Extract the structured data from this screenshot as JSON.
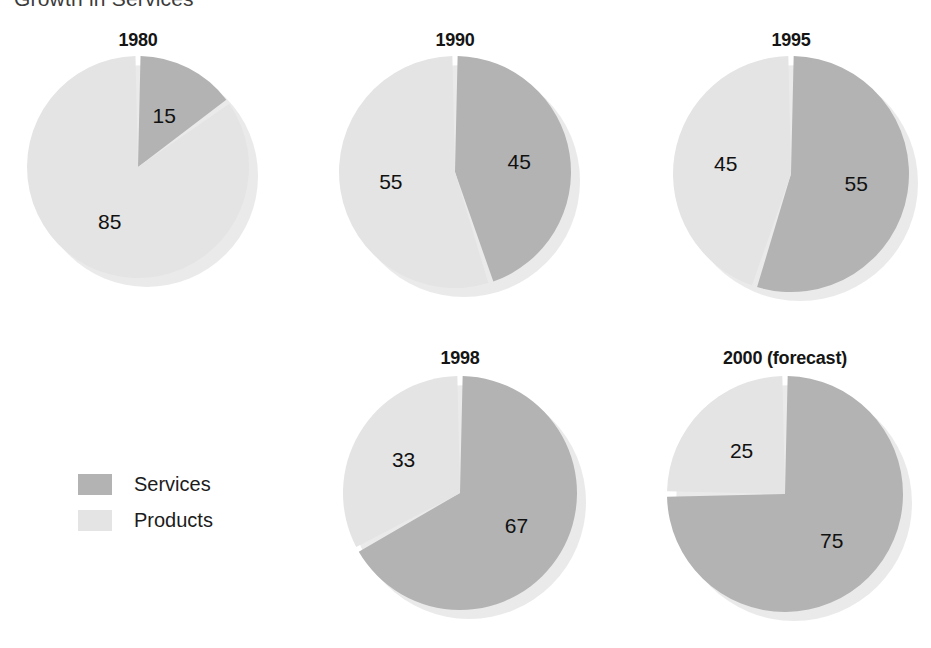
{
  "title": "Growth in Services",
  "legend": {
    "position": "left-middle",
    "items": [
      {
        "label": "Services",
        "color": "#b3b3b3",
        "key": "services"
      },
      {
        "label": "Products",
        "color": "#e4e4e4",
        "key": "products"
      }
    ]
  },
  "colors": {
    "services": "#b3b3b3",
    "products": "#e4e4e4",
    "slice_gap": "#ffffff",
    "shadow": "#d9d9d9",
    "text": "#111111"
  },
  "panels": [
    {
      "title": "1980",
      "services": 15,
      "products": 85,
      "labels": {
        "services": "15",
        "products": "85"
      }
    },
    {
      "title": "1990",
      "services": 45,
      "products": 55,
      "labels": {
        "services": "45",
        "products": "55"
      }
    },
    {
      "title": "1995",
      "services": 55,
      "products": 45,
      "labels": {
        "services": "55",
        "products": "45"
      }
    },
    {
      "title": "1998",
      "services": 67,
      "products": 33,
      "labels": {
        "services": "67",
        "products": "33"
      }
    },
    {
      "title": "2000 (forecast)",
      "services": 75,
      "products": 25,
      "labels": {
        "services": "75",
        "products": "25"
      }
    }
  ],
  "chart_data": {
    "type": "pie",
    "title": "Growth in Services",
    "subtitle": "",
    "xlabel": "",
    "ylabel": "",
    "unit": "percent",
    "legend": [
      "Services",
      "Products"
    ],
    "legend_position": "left-middle",
    "grid": false,
    "series": [
      {
        "name": "Services",
        "values": [
          15,
          45,
          55,
          67,
          75
        ],
        "color": "#b3b3b3"
      },
      {
        "name": "Products",
        "values": [
          85,
          55,
          45,
          33,
          25
        ],
        "color": "#e4e4e4"
      }
    ],
    "categories": [
      "1980",
      "1990",
      "1995",
      "1998",
      "2000 (forecast)"
    ],
    "pies": [
      {
        "title": "1980",
        "slices": [
          {
            "label": "Services",
            "value": 15
          },
          {
            "label": "Products",
            "value": 85
          }
        ]
      },
      {
        "title": "1990",
        "slices": [
          {
            "label": "Services",
            "value": 45
          },
          {
            "label": "Products",
            "value": 55
          }
        ]
      },
      {
        "title": "1995",
        "slices": [
          {
            "label": "Services",
            "value": 55
          },
          {
            "label": "Products",
            "value": 45
          }
        ]
      },
      {
        "title": "1998",
        "slices": [
          {
            "label": "Services",
            "value": 67
          },
          {
            "label": "Products",
            "value": 33
          }
        ]
      },
      {
        "title": "2000 (forecast)",
        "slices": [
          {
            "label": "Services",
            "value": 75
          },
          {
            "label": "Products",
            "value": 25
          }
        ]
      }
    ]
  },
  "layout": {
    "panels": [
      {
        "left": 18,
        "top": 30,
        "width": 240,
        "pie_top": 26,
        "radius": 111
      },
      {
        "left": 335,
        "top": 30,
        "width": 240,
        "pie_top": 26,
        "radius": 116
      },
      {
        "left": 672,
        "top": 30,
        "width": 238,
        "pie_top": 26,
        "radius": 118
      },
      {
        "left": 343,
        "top": 348,
        "width": 234,
        "pie_top": 28,
        "radius": 117
      },
      {
        "left": 660,
        "top": 348,
        "width": 250,
        "pie_top": 28,
        "radius": 118
      }
    ]
  }
}
